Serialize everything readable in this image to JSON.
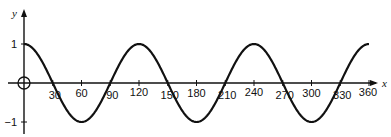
{
  "chart_data": {
    "type": "line",
    "title": "",
    "function": "y = cos 3x",
    "xlabel": "x",
    "ylabel": "y",
    "xlim": [
      0,
      360
    ],
    "ylim": [
      -1,
      1
    ],
    "grid": false,
    "x_ticks": [
      30,
      60,
      90,
      120,
      150,
      180,
      210,
      240,
      270,
      300,
      330,
      360
    ],
    "y_ticks": [
      1,
      -1
    ],
    "y_tick_labels": [
      "1",
      "−1"
    ],
    "origin_marker": "circle-crosshair",
    "series": [
      {
        "name": "cos 3x",
        "x": [
          0,
          30,
          60,
          90,
          120,
          150,
          180,
          210,
          240,
          270,
          300,
          330,
          360
        ],
        "values": [
          1,
          0,
          -1,
          0,
          1,
          0,
          -1,
          0,
          1,
          0,
          -1,
          0,
          1
        ]
      }
    ]
  }
}
